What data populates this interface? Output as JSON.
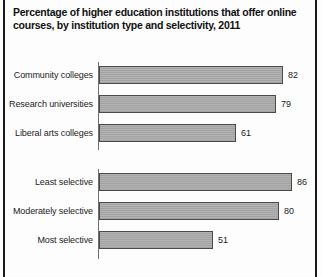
{
  "chart_data": {
    "type": "bar",
    "orientation": "horizontal",
    "title": "Percentage of higher education institutions that offer online courses, by institution type and selectivity, 2011",
    "title_line1": "Percentage of higher education institutions that offer online",
    "title_line2": "courses, by institution type and selectivity, 2011",
    "xlabel": "",
    "ylabel": "",
    "xlim": [
      0,
      100
    ],
    "grid": false,
    "legend": "none",
    "value_suffix": "",
    "bar_color": "#a9a9a9",
    "bar_border_color": "#4a4a4a",
    "axis_color": "#6f6f6f",
    "text_color": "#1c1c1c",
    "categories": [
      "Community colleges",
      "Research universities",
      "Liberal arts colleges",
      "Least selective",
      "Moderately selective",
      "Most selective"
    ],
    "values": [
      82,
      79,
      61,
      86,
      80,
      51
    ],
    "groups": [
      {
        "name": "Institution type",
        "categories": [
          "Community colleges",
          "Research universities",
          "Liberal arts colleges"
        ],
        "values": [
          82,
          79,
          61
        ]
      },
      {
        "name": "Selectivity",
        "categories": [
          "Least selective",
          "Moderately selective",
          "Most selective"
        ],
        "values": [
          86,
          80,
          51
        ]
      }
    ]
  },
  "groups": [
    {
      "rows": [
        {
          "label": "Community colleges",
          "value": "82"
        },
        {
          "label": "Research universities",
          "value": "79"
        },
        {
          "label": "Liberal arts colleges",
          "value": "61"
        }
      ]
    },
    {
      "rows": [
        {
          "label": "Least selective",
          "value": "86"
        },
        {
          "label": "Moderately selective",
          "value": "80"
        },
        {
          "label": "Most selective",
          "value": "51"
        }
      ]
    }
  ]
}
